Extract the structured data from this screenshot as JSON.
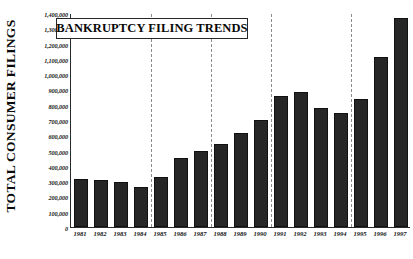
{
  "chart_data": {
    "type": "bar",
    "title": "BANKRUPTCY FILING TRENDS",
    "xlabel": "",
    "ylabel": "TOTAL CONSUMER FILINGS",
    "categories": [
      "1981",
      "1982",
      "1983",
      "1984",
      "1985",
      "1986",
      "1987",
      "1988",
      "1989",
      "1990",
      "1991",
      "1992",
      "1993",
      "1994",
      "1995",
      "1996",
      "1997"
    ],
    "values": [
      315000,
      310000,
      295000,
      265000,
      330000,
      450000,
      500000,
      545000,
      615000,
      700000,
      860000,
      885000,
      780000,
      745000,
      840000,
      1115000,
      1365000
    ],
    "ylim": [
      0,
      1400000
    ],
    "ytick_values": [
      0,
      100000,
      200000,
      300000,
      400000,
      500000,
      600000,
      700000,
      800000,
      900000,
      1000000,
      1100000,
      1200000,
      1300000,
      1400000
    ],
    "ytick_labels": [
      "0",
      "100,000",
      "200,000",
      "300,000",
      "400,000",
      "500,000",
      "600,000",
      "700,000",
      "800,000",
      "900,000",
      "1,000,000",
      "1,100,000",
      "1,200,000",
      "1,300,000",
      "1,400,000"
    ],
    "grid": "vertical-dashed",
    "gridline_after_categories": [
      "1984",
      "1987",
      "1990",
      "1994"
    ],
    "legend": null,
    "bar_color": "#262626",
    "axis_color": "#2a2a2a",
    "gridline_color": "#8c8c8c",
    "background_color": "#ffffff"
  }
}
